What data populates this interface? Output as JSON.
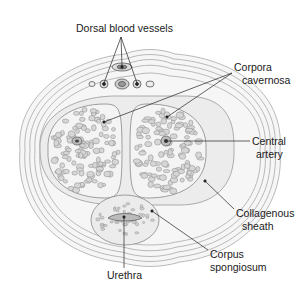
{
  "diagram": {
    "labels": {
      "dorsal_vessels": "Dorsal blood vessels",
      "corpora_cavernosa_1": "Corpora",
      "corpora_cavernosa_2": "cavernosa",
      "central_artery_1": "Central",
      "central_artery_2": "artery",
      "collagenous_sheath_1": "Collagenous",
      "collagenous_sheath_2": "sheath",
      "corpus_spongiosum_1": "Corpus",
      "corpus_spongiosum_2": "spongiosum",
      "urethra": "Urethra"
    },
    "colors": {
      "line": "#333333",
      "tissue_fill": "#f2f2f2",
      "layer_stroke": "#9a9a9a",
      "cell_fill": "#d8d8d8"
    }
  }
}
